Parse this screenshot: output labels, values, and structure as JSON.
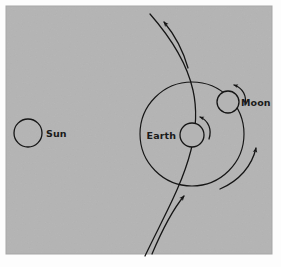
{
  "figure": {
    "background_color": "#b4b4b4",
    "page_color": "#fdfdfd",
    "ink_color": "#151515",
    "plate": {
      "x": 6,
      "y": 6,
      "width": 266,
      "height": 248
    }
  },
  "bodies": {
    "sun": {
      "label": "Sun",
      "cx": 28,
      "cy": 133,
      "r": 14,
      "label_x": 46,
      "label_y": 137
    },
    "earth": {
      "label": "Earth",
      "cx": 192,
      "cy": 135,
      "r": 12,
      "label_x": 176,
      "label_y": 139,
      "label_anchor": "end"
    },
    "moon": {
      "label": "Moon",
      "cx": 228,
      "cy": 102,
      "r": 11,
      "label_x": 241,
      "label_y": 106,
      "label_anchor": "start"
    }
  },
  "orbits": {
    "moon_orbit": {
      "name": "moon-orbit-circle",
      "cx": 192,
      "cy": 134,
      "r": 52
    }
  },
  "paths": {
    "earth_orbit_path": {
      "name": "earth-orbital-path",
      "description": "long curved line through Earth running bottom-left to top-right"
    }
  },
  "arrows": {
    "orbit_direction_top": {
      "name": "earth-orbit-direction-arrow-top",
      "direction": "up-left-along-path"
    },
    "orbit_direction_bottom": {
      "name": "earth-orbit-direction-arrow-bottom",
      "direction": "up-right-along-path"
    },
    "moon_revolution": {
      "name": "moon-revolution-arrow",
      "direction": "counterclockwise"
    },
    "earth_rotation": {
      "name": "earth-rotation-arrow",
      "direction": "counterclockwise"
    },
    "moon_rotation": {
      "name": "moon-rotation-arrow",
      "direction": "counterclockwise"
    }
  }
}
